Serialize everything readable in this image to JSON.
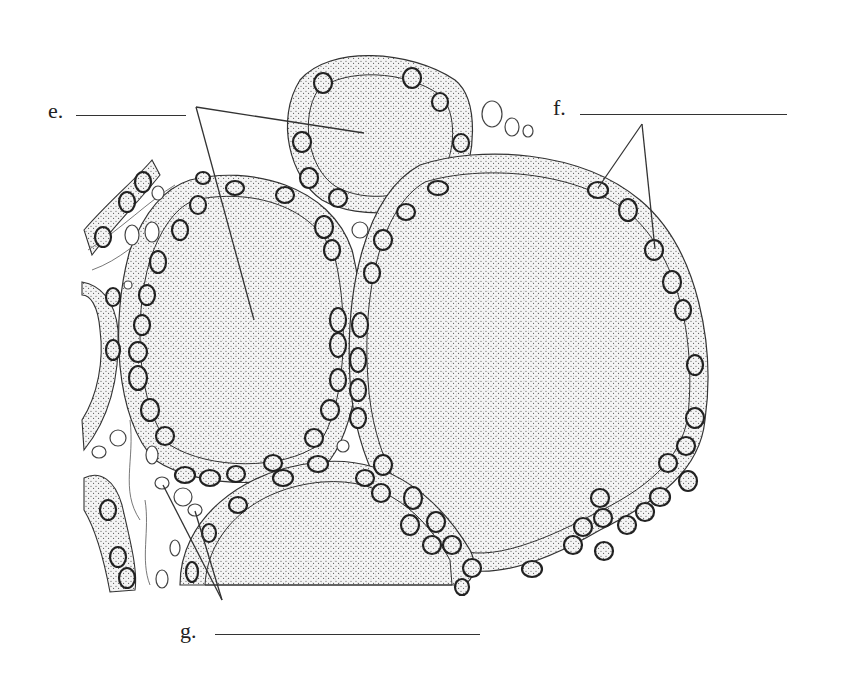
{
  "figure": {
    "colors": {
      "ink": "#222222",
      "colloid_dots": "#b8b8b8",
      "epithelium_dots": "#555555",
      "background": "#ffffff"
    }
  },
  "labels": [
    {
      "id": "e",
      "text": "e.",
      "x": 48,
      "y": 100,
      "blank": {
        "x1": 76,
        "x2": 186,
        "y": 115
      },
      "leaders": [
        {
          "from": [
            196,
            107
          ],
          "to": [
            364,
            133
          ]
        },
        {
          "from": [
            196,
            107
          ],
          "to": [
            254,
            320
          ]
        }
      ]
    },
    {
      "id": "f",
      "text": "f.",
      "x": 553,
      "y": 97,
      "blank": {
        "x1": 580,
        "x2": 787,
        "y": 114
      },
      "leaders": [
        {
          "from": [
            642,
            124
          ],
          "to": [
            598,
            188
          ]
        },
        {
          "from": [
            642,
            124
          ],
          "to": [
            655,
            249
          ]
        }
      ]
    },
    {
      "id": "g",
      "text": "g.",
      "x": 180,
      "y": 620,
      "blank": {
        "x1": 215,
        "x2": 480,
        "y": 634
      },
      "leaders": [
        {
          "from": [
            222,
            600
          ],
          "to": [
            163,
            485
          ]
        },
        {
          "from": [
            222,
            600
          ],
          "to": [
            195,
            511
          ]
        }
      ]
    }
  ]
}
